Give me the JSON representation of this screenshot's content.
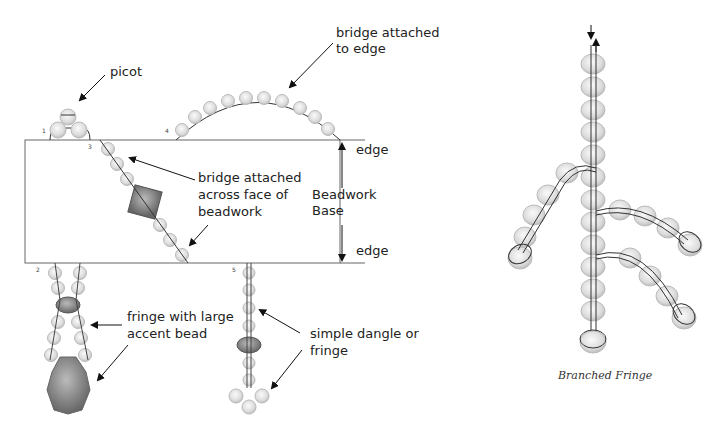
{
  "left_diagram": {
    "labels": {
      "picot": "picot",
      "bridge_edge_1": "bridge attached",
      "bridge_edge_2": "to edge",
      "bridge_face_1": "bridge attached",
      "bridge_face_2": "across face of",
      "bridge_face_3": "beadwork",
      "edge_top": "edge",
      "edge_bottom": "edge",
      "base_1": "Beadwork",
      "base_2": "Base",
      "fringe_accent_1": "fringe with large",
      "fringe_accent_2": "accent bead",
      "dangle_1": "simple dangle or",
      "dangle_2": "fringe"
    },
    "numbers": [
      "1",
      "2",
      "3",
      "4",
      "5"
    ]
  },
  "right_diagram": {
    "caption": "Branched Fringe"
  },
  "colors": {
    "bead_fill": "#e0e0e0",
    "accent_fill": "#888888",
    "line": "#333333"
  }
}
